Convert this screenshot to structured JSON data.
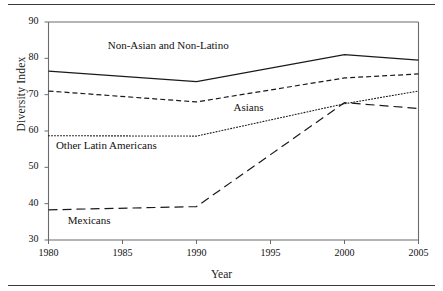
{
  "chart_data": {
    "type": "line",
    "title": "",
    "subtitle": "",
    "xlabel": "Year",
    "ylabel": "Diversity Index",
    "x": [
      1980,
      1990,
      2000,
      2005
    ],
    "xlim": [
      1980,
      2005
    ],
    "ylim": [
      30,
      90
    ],
    "xticks": [
      1980,
      1985,
      1990,
      1995,
      2000,
      2005
    ],
    "yticks": [
      30,
      40,
      50,
      60,
      70,
      80,
      90
    ],
    "xtick_labels": [
      "1980",
      "1985",
      "1990",
      "1995",
      "2000",
      "2005"
    ],
    "ytick_labels": [
      "30",
      "40",
      "50",
      "60",
      "70",
      "80",
      "90"
    ],
    "grid": false,
    "legend": "inline-annotations",
    "series": [
      {
        "name": "Non-Asian and Non-Latino",
        "style": "solid",
        "color": "#1a1a1a",
        "values": [
          76.5,
          73.6,
          81.0,
          79.5
        ],
        "label_x": 1984.0,
        "label_y": 83.0
      },
      {
        "name": "Asians",
        "style": "dashed",
        "color": "#1a1a1a",
        "values": [
          71.0,
          68.0,
          74.6,
          75.7
        ],
        "label_x": 1992.5,
        "label_y": 66.0
      },
      {
        "name": "Other Latin Americans",
        "style": "dotted",
        "color": "#1a1a1a",
        "values": [
          58.7,
          58.6,
          67.5,
          71.0
        ],
        "label_x": 1980.5,
        "label_y": 55.5
      },
      {
        "name": "Mexicans",
        "style": "long-dashed",
        "color": "#1a1a1a",
        "values": [
          38.3,
          39.2,
          67.8,
          66.2
        ],
        "label_x": 1981.3,
        "label_y": 35.0
      }
    ]
  },
  "figure": {
    "top_rule": "",
    "bottom_rule": ""
  }
}
